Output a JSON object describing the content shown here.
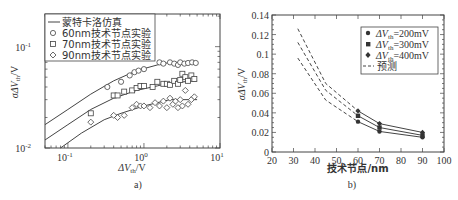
{
  "chart_data": [
    {
      "panel_label": "a)",
      "type": "scatter",
      "xscale": "log",
      "yscale": "log",
      "xlabel": "ΔV_th/V",
      "ylabel": "σΔV_th/V",
      "xlim": [
        0.05,
        10
      ],
      "ylim": [
        0.01,
        0.21
      ],
      "xticks": [
        "10^-1",
        "10^0",
        "10^1"
      ],
      "yticks": [
        "10^-2",
        "10^-1"
      ],
      "grid": false,
      "legend_position": "upper left",
      "legend": [
        "蒙特卡洛仿真",
        "60nm技术节点实验",
        "70nm技术节点实验",
        "90nm技术节点实验"
      ],
      "series": [
        {
          "name": "蒙特卡洛仿真 (60nm)",
          "style": "line",
          "x": [
            0.05,
            0.1,
            0.2,
            0.4,
            0.8,
            1.5,
            2.2,
            5
          ],
          "y": [
            0.017,
            0.024,
            0.034,
            0.046,
            0.058,
            0.066,
            0.07,
            0.07
          ]
        },
        {
          "name": "蒙特卡洛仿真 (70nm)",
          "style": "line",
          "x": [
            0.05,
            0.1,
            0.2,
            0.4,
            0.8,
            1.5,
            2.2,
            5
          ],
          "y": [
            0.012,
            0.017,
            0.024,
            0.031,
            0.037,
            0.041,
            0.044,
            0.046
          ]
        },
        {
          "name": "蒙特卡洛仿真 (90nm)",
          "style": "line",
          "x": [
            0.08,
            0.15,
            0.3,
            0.5,
            1.0,
            1.5,
            2.2,
            5
          ],
          "y": [
            0.01,
            0.014,
            0.019,
            0.022,
            0.026,
            0.028,
            0.03,
            0.03
          ]
        },
        {
          "name": "60nm技术节点实验",
          "marker": "circle",
          "x": [
            0.33,
            0.5,
            0.65,
            0.75,
            0.85,
            1.0,
            1.6,
            1.8,
            2.2,
            2.5,
            2.8,
            3.0,
            3.4,
            3.8,
            4.3,
            4.8
          ],
          "y": [
            0.04,
            0.045,
            0.052,
            0.056,
            0.058,
            0.06,
            0.07,
            0.068,
            0.07,
            0.068,
            0.066,
            0.07,
            0.068,
            0.069,
            0.07,
            0.069
          ]
        },
        {
          "name": "70nm技术节点实验",
          "marker": "square",
          "x": [
            0.2,
            0.4,
            0.45,
            0.55,
            0.7,
            0.8,
            0.9,
            1.0,
            1.3,
            1.5,
            1.8,
            2.0,
            2.2,
            2.5,
            2.8,
            3.0,
            3.2,
            3.5,
            3.8,
            4.2,
            4.6
          ],
          "y": [
            0.022,
            0.033,
            0.033,
            0.036,
            0.037,
            0.039,
            0.041,
            0.041,
            0.04,
            0.045,
            0.043,
            0.043,
            0.042,
            0.046,
            0.043,
            0.047,
            0.054,
            0.05,
            0.046,
            0.052,
            0.048
          ]
        },
        {
          "name": "90nm技术节点实验",
          "marker": "diamond",
          "x": [
            0.2,
            0.4,
            0.45,
            0.55,
            0.7,
            0.8,
            0.9,
            1.0,
            1.2,
            1.4,
            1.6,
            1.8,
            2.0,
            2.2,
            2.4,
            2.6,
            2.8,
            3.0,
            3.2,
            3.5,
            3.8,
            4.2,
            4.6
          ],
          "y": [
            0.018,
            0.021,
            0.02,
            0.021,
            0.025,
            0.027,
            0.026,
            0.026,
            0.025,
            0.028,
            0.026,
            0.029,
            0.025,
            0.031,
            0.027,
            0.029,
            0.025,
            0.03,
            0.026,
            0.037,
            0.027,
            0.03,
            0.032
          ]
        }
      ]
    },
    {
      "panel_label": "b)",
      "type": "line",
      "xlabel": "技术节点/nm",
      "ylabel": "σΔV_th/V",
      "xlim": [
        20,
        100
      ],
      "ylim": [
        0,
        0.14
      ],
      "xticks": [
        "20",
        "30",
        "40",
        "50",
        "60",
        "70",
        "80",
        "90",
        "100"
      ],
      "yticks": [
        "0",
        "0.02",
        "0.04",
        "0.06",
        "0.08",
        "0.1",
        "0.12",
        "0.14"
      ],
      "grid": false,
      "legend_position": "upper right",
      "legend": [
        "ΔV_th=200mV",
        "ΔV_th=300mV",
        "ΔV_th=400mV",
        "预测"
      ],
      "series": [
        {
          "name": "ΔV_th=200mV",
          "marker": "circle",
          "style": "solid",
          "x": [
            60,
            70,
            90
          ],
          "y": [
            0.031,
            0.021,
            0.015
          ]
        },
        {
          "name": "ΔV_th=300mV",
          "marker": "square",
          "style": "solid",
          "x": [
            60,
            70,
            90
          ],
          "y": [
            0.037,
            0.025,
            0.017
          ]
        },
        {
          "name": "ΔV_th=400mV",
          "marker": "diamond",
          "style": "solid",
          "x": [
            60,
            70,
            90
          ],
          "y": [
            0.042,
            0.029,
            0.02
          ]
        },
        {
          "name": "预测 (200mV)",
          "style": "dashed",
          "x": [
            32,
            45,
            60
          ],
          "y": [
            0.096,
            0.053,
            0.031
          ]
        },
        {
          "name": "预测 (300mV)",
          "style": "dashed",
          "x": [
            32,
            45,
            60
          ],
          "y": [
            0.112,
            0.063,
            0.037
          ]
        },
        {
          "name": "预测 (400mV)",
          "style": "dashed",
          "x": [
            32,
            45,
            60
          ],
          "y": [
            0.126,
            0.07,
            0.042
          ]
        }
      ]
    }
  ],
  "panel_a": {
    "label": "a)",
    "xlabel": "ΔV",
    "xlabel_sub": "th",
    "xlabel_unit": "/V",
    "ylabel": "σΔV",
    "ylabel_sub": "th",
    "ylabel_unit": "/V",
    "legend": [
      "蒙特卡洛仿真",
      "60nm技术节点实验",
      "70nm技术节点实验",
      "90nm技术节点实验"
    ]
  },
  "panel_b": {
    "label": "b)",
    "xlabel": "技术节点/nm",
    "ylabel": "σΔV",
    "ylabel_sub": "th",
    "ylabel_unit": "/V",
    "legend_prefix": "ΔV",
    "legend_sub": "th",
    "legend_values": [
      "=200mV",
      "=300mV",
      "=400mV"
    ],
    "legend_predict": "预测"
  }
}
